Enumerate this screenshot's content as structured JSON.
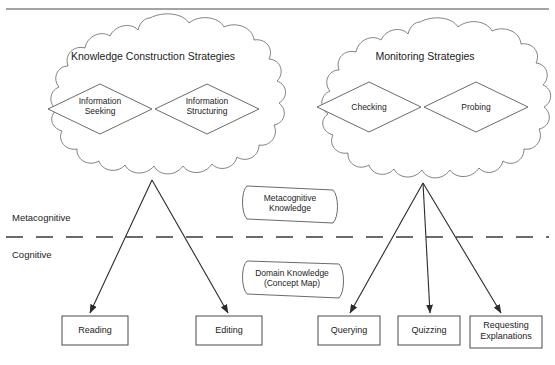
{
  "diagram": {
    "title_alt": "Metacognitive and Cognitive Strategy Diagram",
    "clouds": [
      {
        "id": "knowledge-construction",
        "title": "Knowledge Construction Strategies",
        "diamonds": [
          {
            "id": "information-seeking",
            "line1": "Information",
            "line2": "Seeking"
          },
          {
            "id": "information-structuring",
            "line1": "Information",
            "line2": "Structuring"
          }
        ]
      },
      {
        "id": "monitoring",
        "title": "Monitoring Strategies",
        "diamonds": [
          {
            "id": "checking",
            "line1": "Checking",
            "line2": ""
          },
          {
            "id": "probing",
            "line1": "Probing",
            "line2": ""
          }
        ]
      }
    ],
    "layers": [
      {
        "id": "metacognitive",
        "label": "Metacognitive"
      },
      {
        "id": "cognitive",
        "label": "Cognitive"
      }
    ],
    "knowledge_stores": [
      {
        "id": "metacognitive-knowledge",
        "line1": "Metacognitive",
        "line2": "Knowledge"
      },
      {
        "id": "domain-knowledge",
        "line1": "Domain Knowledge",
        "line2": "(Concept Map)"
      }
    ],
    "actions": [
      {
        "id": "reading",
        "line1": "Reading",
        "line2": ""
      },
      {
        "id": "editing",
        "line1": "Editing",
        "line2": ""
      },
      {
        "id": "querying",
        "line1": "Querying",
        "line2": ""
      },
      {
        "id": "quizzing",
        "line1": "Quizzing",
        "line2": ""
      },
      {
        "id": "requesting-explanations",
        "line1": "Requesting",
        "line2": "Explanations"
      }
    ],
    "colors": {
      "background": "#ffffff",
      "outline": "#5a5a5a",
      "arrow": "#2b2b2b",
      "text": "#1c1c1c",
      "divider": "#3a3a3a"
    }
  }
}
